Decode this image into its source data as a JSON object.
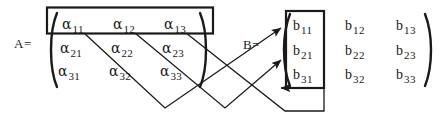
{
  "figure": {
    "ink_color": "#1a1a1a"
  },
  "matrix_a": {
    "label": "A=",
    "highlight_row": 1,
    "rows": [
      [
        {
          "base": "α",
          "sub": "11"
        },
        {
          "base": "α",
          "sub": "12"
        },
        {
          "base": "α",
          "sub": "13"
        }
      ],
      [
        {
          "base": "α",
          "sub": "21"
        },
        {
          "base": "α",
          "sub": "22"
        },
        {
          "base": "α",
          "sub": "23"
        }
      ],
      [
        {
          "base": "α",
          "sub": "31"
        },
        {
          "base": "α",
          "sub": "32"
        },
        {
          "base": "α",
          "sub": "33"
        }
      ]
    ]
  },
  "matrix_b": {
    "label": "B=",
    "highlight_column": 1,
    "rows": [
      [
        {
          "base": "b",
          "sub": "11"
        },
        {
          "base": "b",
          "sub": "12"
        },
        {
          "base": "b",
          "sub": "13"
        }
      ],
      [
        {
          "base": "b",
          "sub": "21"
        },
        {
          "base": "b",
          "sub": "22"
        },
        {
          "base": "b",
          "sub": "23"
        }
      ],
      [
        {
          "base": "b",
          "sub": "31"
        },
        {
          "base": "b",
          "sub": "32"
        },
        {
          "base": "b",
          "sub": "33"
        }
      ]
    ]
  },
  "connectors": [
    {
      "from": "alpha-11",
      "to": "b-11"
    },
    {
      "from": "alpha-12",
      "to": "b-21"
    },
    {
      "from": "alpha-13",
      "to": "b-31"
    }
  ]
}
